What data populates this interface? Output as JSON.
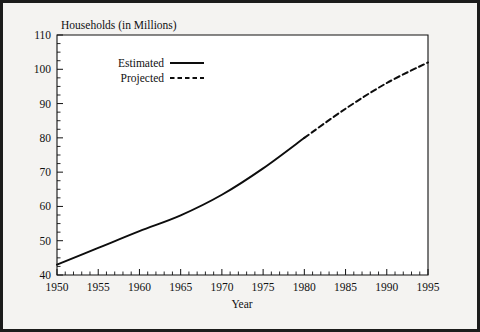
{
  "figure": {
    "background_color": "#f4f3f1",
    "border_color": "#1b1b1b",
    "plot_background": "#ffffff",
    "line_color": "#0d0d0d"
  },
  "axis_titles": {
    "y": "Households (in Millions)",
    "x": "Year"
  },
  "legend": {
    "estimated_label": "Estimated",
    "projected_label": "Projected"
  },
  "chart_data": {
    "type": "line",
    "title": "",
    "ylabel": "Households (in Millions)",
    "xlabel": "Year",
    "xlim": [
      1950,
      1995
    ],
    "ylim": [
      40,
      110
    ],
    "yticks": [
      40,
      50,
      60,
      70,
      80,
      90,
      100,
      110
    ],
    "ytick_labels": [
      "40",
      "50",
      "60",
      "70",
      "80",
      "90",
      "100",
      "110"
    ],
    "y_minor_tick_interval": 2.5,
    "xticks": [
      1950,
      1955,
      1960,
      1965,
      1970,
      1975,
      1980,
      1985,
      1990,
      1995
    ],
    "xtick_labels": [
      "1950",
      "1955",
      "1960",
      "1965",
      "1970",
      "1975",
      "1980",
      "1985",
      "1990",
      "1995"
    ],
    "x_minor_tick_interval": 1,
    "grid": false,
    "legend_position": "upper left",
    "series": [
      {
        "name": "Estimated",
        "style": "solid",
        "x": [
          1950,
          1955,
          1960,
          1965,
          1970,
          1975,
          1980
        ],
        "values": [
          43.0,
          47.9,
          52.8,
          57.4,
          63.4,
          71.1,
          80.0
        ]
      },
      {
        "name": "Projected",
        "style": "dashed",
        "x": [
          1980,
          1985,
          1990,
          1995
        ],
        "values": [
          80.0,
          88.5,
          96.0,
          102.0
        ]
      }
    ]
  }
}
